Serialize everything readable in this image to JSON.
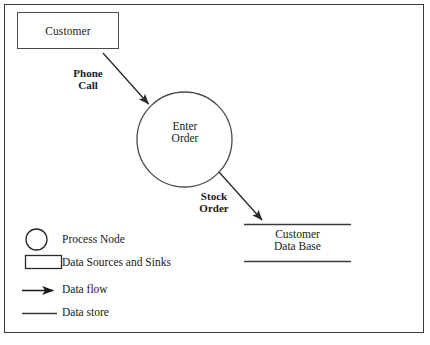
{
  "diagram": {
    "external_entities": [
      {
        "id": "customer",
        "label": "Customer"
      }
    ],
    "processes": [
      {
        "id": "enter-order",
        "label_line1": "Enter",
        "label_line2": "Order"
      }
    ],
    "data_stores": [
      {
        "id": "customer-data-base",
        "label_line1": "Customer",
        "label_line2": "Data Base"
      }
    ],
    "data_flows": [
      {
        "id": "phone-call",
        "label_line1": "Phone",
        "label_line2": "Call",
        "from": "customer",
        "to": "enter-order"
      },
      {
        "id": "stock-order",
        "label_line1": "Stock",
        "label_line2": "Order",
        "from": "enter-order",
        "to": "customer-data-base"
      }
    ]
  },
  "legend": {
    "items": [
      {
        "symbol": "circle",
        "label": "Process Node"
      },
      {
        "symbol": "rectangle",
        "label": "Data Sources and Sinks"
      },
      {
        "symbol": "arrow",
        "label": "Data flow"
      },
      {
        "symbol": "line",
        "label": "Data store"
      }
    ]
  },
  "colors": {
    "stroke": "#3a3a3a",
    "shape_stroke": "#4a4a4a",
    "text": "#1a1a1a",
    "background": "#ffffff"
  }
}
